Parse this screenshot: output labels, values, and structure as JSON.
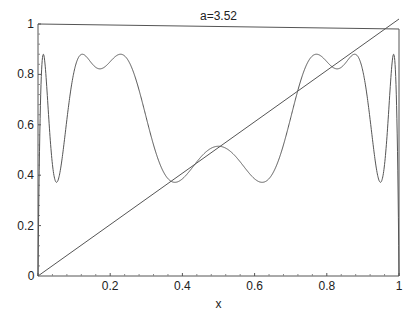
{
  "chart_data": {
    "type": "line",
    "title": "a=3.52",
    "xlabel": "x",
    "ylabel": "",
    "xlim": [
      0,
      1
    ],
    "ylim": [
      0,
      1
    ],
    "grid": false,
    "legend": "none",
    "x_ticks": [
      {
        "value": 0,
        "label": "0"
      },
      {
        "value": 0.2,
        "label": "0.2"
      },
      {
        "value": 0.4,
        "label": "0.4"
      },
      {
        "value": 0.6,
        "label": "0.6"
      },
      {
        "value": 0.8,
        "label": "0.8"
      },
      {
        "value": 1,
        "label": "1"
      }
    ],
    "y_ticks": [
      {
        "value": 0,
        "label": "0"
      },
      {
        "value": 0.2,
        "label": "0.2"
      },
      {
        "value": 0.4,
        "label": "0.4"
      },
      {
        "value": 0.6,
        "label": "0.6"
      },
      {
        "value": 0.8,
        "label": "0.8"
      },
      {
        "value": 1,
        "label": "1"
      }
    ],
    "parameter_a": 3.52,
    "series": [
      {
        "name": "fourth iterate of logistic map",
        "formula": "f(f(f(f(x)))), f(x)=a*x*(1-x)",
        "key_points": [
          {
            "x": 0.0,
            "y": 0.0
          },
          {
            "x": 0.015,
            "y": 0.88
          },
          {
            "x": 0.055,
            "y": 0.37
          },
          {
            "x": 0.13,
            "y": 0.88
          },
          {
            "x": 0.18,
            "y": 0.82
          },
          {
            "x": 0.24,
            "y": 0.88
          },
          {
            "x": 0.37,
            "y": 0.37
          },
          {
            "x": 0.5,
            "y": 0.5
          },
          {
            "x": 0.63,
            "y": 0.36
          },
          {
            "x": 0.76,
            "y": 0.87
          },
          {
            "x": 0.82,
            "y": 0.81
          },
          {
            "x": 0.87,
            "y": 0.86
          },
          {
            "x": 0.945,
            "y": 0.36
          },
          {
            "x": 0.985,
            "y": 0.86
          },
          {
            "x": 1.0,
            "y": 0.0
          }
        ]
      },
      {
        "name": "identity line",
        "formula": "y=x",
        "key_points": [
          {
            "x": 0,
            "y": 0
          },
          {
            "x": 1,
            "y": 1
          }
        ]
      }
    ]
  }
}
